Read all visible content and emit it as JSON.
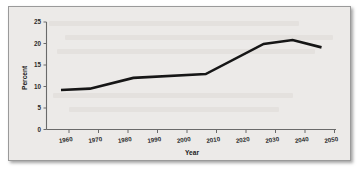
{
  "figure": {
    "background_color": "#eceae8",
    "border_color": "#9a9a9a",
    "line_color": "#161616",
    "axis_color": "#6a6a6a"
  },
  "chart_data": {
    "type": "line",
    "title": "",
    "xlabel": "Year",
    "ylabel": "Percent",
    "xlim": [
      1955,
      2055
    ],
    "ylim": [
      0,
      25
    ],
    "grid": false,
    "legend": "none",
    "xticks": [
      1960,
      1970,
      1980,
      1990,
      2000,
      2010,
      2020,
      2030,
      2040,
      2050
    ],
    "xtick_labels": [
      "1960",
      "1970",
      "1980",
      "1990",
      "2000",
      "2010",
      "2020",
      "2030",
      "2040",
      "2050"
    ],
    "yticks": [
      0,
      5,
      10,
      15,
      20,
      25
    ],
    "ytick_labels": [
      "0",
      "5",
      "10",
      "15",
      "20",
      "25"
    ],
    "series": [
      {
        "name": "Percent",
        "x": [
          1960,
          1970,
          1985,
          2010,
          2030,
          2040,
          2050
        ],
        "values": [
          9.2,
          9.5,
          12.0,
          12.9,
          19.9,
          20.8,
          19.1
        ]
      }
    ]
  }
}
